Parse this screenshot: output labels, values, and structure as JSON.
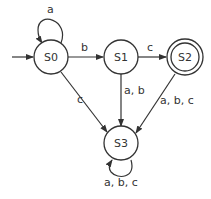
{
  "diagram": {
    "type": "finite-state-automaton",
    "colors": {
      "stroke": "#333333",
      "text": "#333333",
      "background": "#ffffff"
    },
    "states": [
      {
        "id": "S0",
        "label": "S0",
        "initial": true,
        "accepting": false
      },
      {
        "id": "S1",
        "label": "S1",
        "initial": false,
        "accepting": false
      },
      {
        "id": "S2",
        "label": "S2",
        "initial": false,
        "accepting": true
      },
      {
        "id": "S3",
        "label": "S3",
        "initial": false,
        "accepting": false
      }
    ],
    "transitions": [
      {
        "from": "S0",
        "to": "S0",
        "label": "a"
      },
      {
        "from": "S0",
        "to": "S1",
        "label": "b"
      },
      {
        "from": "S1",
        "to": "S2",
        "label": "c"
      },
      {
        "from": "S0",
        "to": "S3",
        "label": "c"
      },
      {
        "from": "S1",
        "to": "S3",
        "label": "a, b"
      },
      {
        "from": "S2",
        "to": "S3",
        "label": "a, b, c"
      },
      {
        "from": "S3",
        "to": "S3",
        "label": "a, b, c"
      }
    ]
  }
}
